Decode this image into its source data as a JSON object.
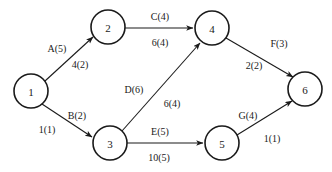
{
  "diagram": {
    "background_color": "#ffffff",
    "stroke_color": "#1a1a1a",
    "nodes": [
      {
        "id": "1",
        "label": "1",
        "cx": 31,
        "cy": 91,
        "r": 17
      },
      {
        "id": "2",
        "label": "2",
        "cx": 108,
        "cy": 27,
        "r": 17
      },
      {
        "id": "3",
        "label": "3",
        "cx": 110,
        "cy": 143,
        "r": 17
      },
      {
        "id": "4",
        "label": "4",
        "cx": 212,
        "cy": 28,
        "r": 17
      },
      {
        "id": "5",
        "label": "5",
        "cx": 222,
        "cy": 143,
        "r": 17
      },
      {
        "id": "6",
        "label": "6",
        "cx": 305,
        "cy": 89,
        "r": 17
      }
    ],
    "edges": [
      {
        "id": "edge-1-2",
        "from": "1",
        "to": "2",
        "x1": 45,
        "y1": 81,
        "x2": 93,
        "y2": 37,
        "upper_label": "A(5)",
        "lower_label": "4(2)",
        "upper_x": 57,
        "upper_y": 48,
        "lower_x": 80,
        "lower_y": 64
      },
      {
        "id": "edge-1-3",
        "from": "1",
        "to": "3",
        "x1": 42,
        "y1": 104,
        "x2": 92,
        "y2": 137,
        "upper_label": "B(2)",
        "lower_label": "1(1)",
        "upper_x": 77,
        "upper_y": 115,
        "lower_x": 47,
        "lower_y": 129
      },
      {
        "id": "edge-2-4",
        "from": "2",
        "to": "4",
        "x1": 125,
        "y1": 28,
        "x2": 193,
        "y2": 28,
        "upper_label": "C(4)",
        "lower_label": "6(4)",
        "upper_x": 160,
        "upper_y": 16,
        "lower_x": 160,
        "lower_y": 42
      },
      {
        "id": "edge-3-4",
        "from": "3",
        "to": "4",
        "x1": 122,
        "y1": 131,
        "x2": 200,
        "y2": 43,
        "upper_label": "D(6)",
        "lower_label": "6(4)",
        "upper_x": 134,
        "upper_y": 89,
        "lower_x": 172,
        "lower_y": 103
      },
      {
        "id": "edge-3-5",
        "from": "3",
        "to": "5",
        "x1": 127,
        "y1": 143,
        "x2": 203,
        "y2": 143,
        "upper_label": "E(5)",
        "lower_label": "10(5)",
        "upper_x": 160,
        "upper_y": 131,
        "lower_x": 159,
        "lower_y": 157
      },
      {
        "id": "edge-4-6",
        "from": "4",
        "to": "6",
        "x1": 226,
        "y1": 38,
        "x2": 293,
        "y2": 77,
        "upper_label": "F(3)",
        "lower_label": "2(2)",
        "upper_x": 279,
        "upper_y": 43,
        "lower_x": 254,
        "lower_y": 65
      },
      {
        "id": "edge-5-6",
        "from": "5",
        "to": "6",
        "x1": 237,
        "y1": 135,
        "x2": 292,
        "y2": 101,
        "upper_label": "G(4)",
        "lower_label": "1(1)",
        "upper_x": 248,
        "upper_y": 115,
        "lower_x": 272,
        "lower_y": 138
      }
    ]
  }
}
